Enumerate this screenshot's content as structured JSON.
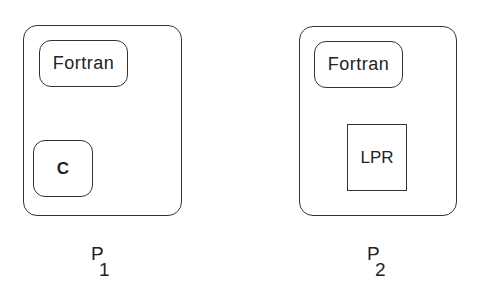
{
  "diagram": {
    "processes": [
      {
        "id": "p1",
        "label": "P",
        "subscript": "1",
        "components": [
          {
            "name": "Fortran",
            "shape": "rounded-rect"
          },
          {
            "name": "C",
            "shape": "rounded-rect"
          }
        ]
      },
      {
        "id": "p2",
        "label": "P",
        "subscript": "2",
        "components": [
          {
            "name": "Fortran",
            "shape": "rounded-rect"
          },
          {
            "name": "LPR",
            "shape": "rect"
          }
        ]
      }
    ]
  }
}
